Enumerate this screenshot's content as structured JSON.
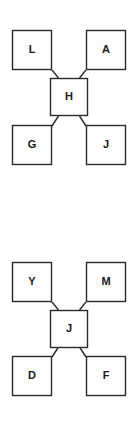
{
  "page": {
    "background_color": "#ffffff",
    "width": 137,
    "height": 440
  },
  "style": {
    "box_fill": "#fdfdfd",
    "box_stroke": "#2b2b2b",
    "label_color": "#1a1a1a",
    "connector_color": "#2b2b2b"
  },
  "diagrams": [
    {
      "id": "diagram-1",
      "center": {
        "label": "H"
      },
      "nodes": {
        "top_left": {
          "label": "L"
        },
        "top_right": {
          "label": "A"
        },
        "bottom_left": {
          "label": "G"
        },
        "bottom_right": {
          "label": "J"
        }
      }
    },
    {
      "id": "diagram-2",
      "center": {
        "label": "J"
      },
      "nodes": {
        "top_left": {
          "label": "Y"
        },
        "top_right": {
          "label": "M"
        },
        "bottom_left": {
          "label": "D"
        },
        "bottom_right": {
          "label": "F"
        }
      }
    }
  ]
}
